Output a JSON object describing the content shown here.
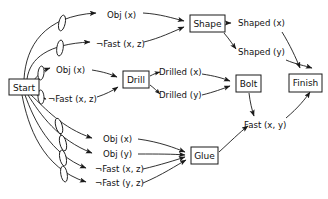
{
  "diagram": {
    "colors": {
      "stroke": "#1a1a1a",
      "fill": "#ffffff",
      "text": "#111111"
    },
    "nodes": [
      {
        "id": "start",
        "label": "Start",
        "x": 9,
        "y": 79,
        "w": 30,
        "h": 16
      },
      {
        "id": "shape",
        "label": "Shape",
        "x": 190,
        "y": 15,
        "w": 35,
        "h": 17
      },
      {
        "id": "drill",
        "label": "Drill",
        "x": 123,
        "y": 71,
        "w": 26,
        "h": 17
      },
      {
        "id": "bolt",
        "label": "Bolt",
        "x": 236,
        "y": 75,
        "w": 25,
        "h": 17
      },
      {
        "id": "finish",
        "label": "Finish",
        "x": 289,
        "y": 74,
        "w": 33,
        "h": 18
      },
      {
        "id": "glue",
        "label": "Glue",
        "x": 191,
        "y": 147,
        "w": 27,
        "h": 17
      }
    ],
    "edge_labels": [
      {
        "id": "obj-x-top",
        "text": "Obj (x)",
        "x": 107,
        "y": 15
      },
      {
        "id": "not-fast-xz-top",
        "text": "¬Fast (x, z)",
        "x": 98,
        "y": 44
      },
      {
        "id": "obj-x-drill",
        "text": "Obj (x)",
        "x": 57,
        "y": 70
      },
      {
        "id": "not-fast-xz-drill",
        "text": "¬Fast (x, z)",
        "x": 49,
        "y": 99
      },
      {
        "id": "drilled-x",
        "text": "Drilled (x)",
        "x": 160,
        "y": 72
      },
      {
        "id": "drilled-y",
        "text": "Drilled (y)",
        "x": 160,
        "y": 95
      },
      {
        "id": "shaped-x",
        "text": "Shaped (x)",
        "x": 240,
        "y": 23
      },
      {
        "id": "shaped-y",
        "text": "Shaped (y)",
        "x": 240,
        "y": 52
      },
      {
        "id": "fast-xy",
        "text": "Fast (x, y)",
        "x": 244,
        "y": 125
      },
      {
        "id": "obj-x-glue",
        "text": "Obj (x)",
        "x": 104,
        "y": 141
      },
      {
        "id": "obj-y-glue",
        "text": "Obj (y)",
        "x": 104,
        "y": 155
      },
      {
        "id": "not-fast-xz-glue",
        "text": "¬Fast (x, z)",
        "x": 96,
        "y": 170
      },
      {
        "id": "not-fast-yz-glue",
        "text": "¬Fast (y, z)",
        "x": 96,
        "y": 184
      }
    ]
  }
}
